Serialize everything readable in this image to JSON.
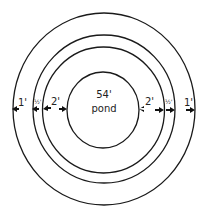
{
  "diagram": {
    "center_label": {
      "size": "54'",
      "name": "pond"
    },
    "rings": [
      {
        "id": "pond",
        "diameter_label": "54'"
      },
      {
        "id": "ring-1",
        "width_label": "2'"
      },
      {
        "id": "ring-2",
        "width_label": "½'"
      },
      {
        "id": "ring-3",
        "width_label": "1'"
      }
    ],
    "left_labels": [
      "1'",
      "½'",
      "2'"
    ],
    "right_labels": [
      "2'",
      "½'",
      "1'"
    ],
    "colors": {
      "stroke": "#1a1a1a",
      "background": "#ffffff"
    }
  }
}
